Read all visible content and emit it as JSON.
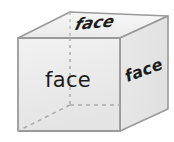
{
  "figure": {
    "name": "cube-faces-diagram",
    "background_color": "#ffffff",
    "edge_color": "#9a9a9a",
    "hidden_edge_color": "#a8a8a8",
    "text_color": "#1c1c1c",
    "faces": {
      "front": {
        "label": "face",
        "fill_color": "#ebebeb",
        "label_x": 68,
        "label_y": 81
      },
      "top": {
        "label": "face",
        "fill_color": "#efefef",
        "label_x": 103,
        "label_y": 23,
        "transform": "rotate(-6 103 23) skewX(-22)"
      },
      "right": {
        "label": "face",
        "fill_color": "#e6e6e6",
        "label_x": 144,
        "label_y": 71,
        "transform": "rotate(-20 144 71)"
      }
    },
    "geometry": {
      "front_face_points": "18,38 120,38 120,131 18,131",
      "top_face_points": "18,38 70,12 168,16 120,38",
      "right_face_points": "120,38 168,16 168,109 120,131",
      "hidden_vertex_x": 70,
      "hidden_vertex_y": 105,
      "hidden_vertical_from_y": 38,
      "hidden_vertical_to_y": 105,
      "hidden_horizontal_to_x": 120,
      "hidden_diagonal_to_x": 18,
      "hidden_diagonal_to_y": 131,
      "hidden_back_left_edge_to_x": 18,
      "hidden_back_left_edge_to_y": 38
    }
  }
}
